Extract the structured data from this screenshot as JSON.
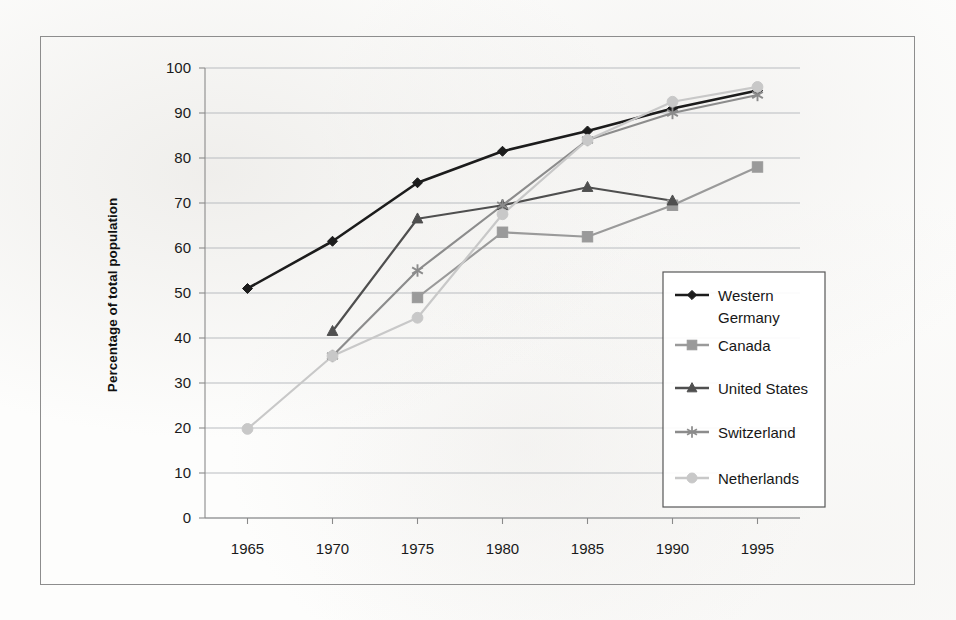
{
  "chart_data": {
    "type": "line",
    "title": "",
    "xlabel": "",
    "ylabel": "Percentage of total population",
    "x": [
      1965,
      1970,
      1975,
      1980,
      1985,
      1990,
      1995
    ],
    "categories": [
      "1965",
      "1970",
      "1975",
      "1980",
      "1985",
      "1990",
      "1995"
    ],
    "xlim": [
      1962.5,
      1997.5
    ],
    "ylim": [
      0,
      100
    ],
    "ytick_labels": [
      "0",
      "10",
      "20",
      "30",
      "40",
      "50",
      "60",
      "70",
      "80",
      "90",
      "100"
    ],
    "ytick_values": [
      0,
      10,
      20,
      30,
      40,
      50,
      60,
      70,
      80,
      90,
      100
    ],
    "grid": "horizontal",
    "legend_position": "inside-right",
    "series": [
      {
        "name": "Western Germany",
        "color": "#1c1c1c",
        "marker": "diamond",
        "x": [
          1965,
          1970,
          1975,
          1980,
          1985,
          1990,
          1995
        ],
        "values": [
          51,
          61.5,
          74.5,
          81.5,
          86,
          91,
          95
        ]
      },
      {
        "name": "Canada",
        "color": "#9a9a9a",
        "marker": "square",
        "x": [
          1975,
          1980,
          1985,
          1990,
          1995
        ],
        "values": [
          49,
          63.5,
          62.5,
          69.5,
          78
        ]
      },
      {
        "name": "United States",
        "color": "#4f4f4f",
        "marker": "triangle",
        "x": [
          1970,
          1975,
          1980,
          1985,
          1990
        ],
        "values": [
          41.5,
          66.5,
          69.5,
          73.5,
          70.5
        ]
      },
      {
        "name": "Switzerland",
        "color": "#8c8c8c",
        "marker": "star",
        "x": [
          1970,
          1975,
          1980,
          1985,
          1990,
          1995
        ],
        "values": [
          36,
          55,
          69.5,
          84,
          90,
          94
        ]
      },
      {
        "name": "Netherlands",
        "color": "#c8c8c8",
        "marker": "circle",
        "x": [
          1965,
          1970,
          1975,
          1980,
          1985,
          1990,
          1995
        ],
        "values": [
          19.8,
          36,
          44.5,
          67.5,
          84,
          92.5,
          95.8
        ]
      }
    ],
    "legend_entries": [
      {
        "label": "Western Germany",
        "color": "#1c1c1c",
        "marker": "diamond"
      },
      {
        "label": "Canada",
        "color": "#9a9a9a",
        "marker": "square"
      },
      {
        "label": "United States",
        "color": "#4f4f4f",
        "marker": "triangle"
      },
      {
        "label": "Switzerland",
        "color": "#8c8c8c",
        "marker": "star"
      },
      {
        "label": "Netherlands",
        "color": "#c8c8c8",
        "marker": "circle"
      }
    ]
  }
}
